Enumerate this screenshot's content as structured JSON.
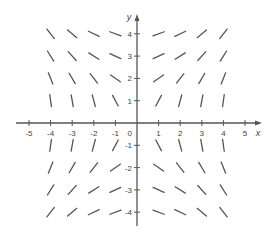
{
  "chart_data": {
    "type": "slope_field",
    "title": "",
    "xlabel": "x",
    "ylabel": "y",
    "xlim": [
      -5.5,
      5.8
    ],
    "ylim": [
      -4.5,
      4.9
    ],
    "x_ticks": [
      -5,
      -4,
      -3,
      -2,
      -1,
      1,
      2,
      3,
      4,
      5
    ],
    "y_ticks": [
      -4,
      -3,
      -2,
      -1,
      1,
      2,
      3,
      4
    ],
    "origin_label": "0",
    "grid": false,
    "grid_x": [
      -4,
      -3,
      -2,
      -1,
      1,
      2,
      3,
      4
    ],
    "grid_y": [
      -4,
      -3,
      -2,
      -1,
      1,
      2,
      3,
      4
    ],
    "angle_magnitude_deg_by_abs_xy": {
      "1": {
        "1": 62,
        "2": 35,
        "3": 25,
        "4": 20
      },
      "2": {
        "1": 75,
        "2": 52,
        "3": 32,
        "4": 25
      },
      "3": {
        "1": 80,
        "2": 60,
        "3": 48,
        "4": 40
      },
      "4": {
        "1": 82,
        "2": 68,
        "3": 58,
        "4": 52
      }
    },
    "slope_sign_rule": "sign(x*y)"
  },
  "colors": {
    "axis": "#555555",
    "segment": "#555555",
    "label": "#444444"
  }
}
